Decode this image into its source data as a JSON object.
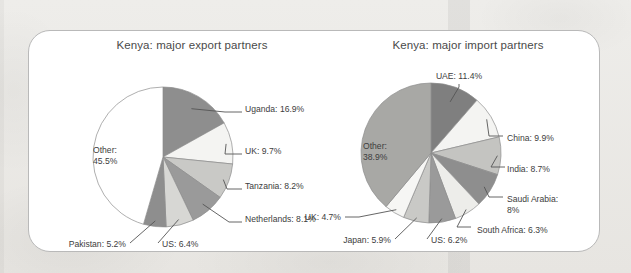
{
  "figure": {
    "background_color": "#ebeae7",
    "card_color": "#ffffff",
    "card_border_color": "#b9b9b9"
  },
  "chart_data": [
    {
      "type": "pie",
      "id": "kenya-major-export-partners",
      "title": "Kenya: major export partners",
      "xlabel": "",
      "ylabel": "",
      "grid": false,
      "legend": "none",
      "label_format": "{name}: {value}%",
      "categories": [
        "Uganda",
        "UK",
        "Tanzania",
        "Netherlands",
        "US",
        "Pakistan",
        "Other"
      ],
      "values": [
        16.9,
        9.7,
        8.2,
        8.1,
        6.4,
        5.2,
        45.5
      ],
      "colors": [
        "#8e8e8e",
        "#f4f4f2",
        "#c9c9c6",
        "#9a9a9a",
        "#d7d7d4",
        "#8e8e8e",
        "#ffffff"
      ],
      "slices": [
        {
          "name": "Uganda",
          "value": 16.9,
          "label": "Uganda: 16.9%",
          "color": "#8e8e8e"
        },
        {
          "name": "UK",
          "value": 9.7,
          "label": "UK: 9.7%",
          "color": "#f4f4f2"
        },
        {
          "name": "Tanzania",
          "value": 8.2,
          "label": "Tanzania: 8.2%",
          "color": "#c9c9c6"
        },
        {
          "name": "Netherlands",
          "value": 8.1,
          "label": "Netherlands: 8.1%",
          "color": "#9a9a9a"
        },
        {
          "name": "US",
          "value": 6.4,
          "label": "US: 6.4%",
          "color": "#d7d7d4"
        },
        {
          "name": "Pakistan",
          "value": 5.2,
          "label": "Pakistan: 5.2%",
          "color": "#8e8e8e"
        },
        {
          "name": "Other",
          "value": 45.5,
          "label": "Other:",
          "label2": "45.5%",
          "color": "#ffffff",
          "inside": true
        }
      ]
    },
    {
      "type": "pie",
      "id": "kenya-major-import-partners",
      "title": "Kenya: major import partners",
      "xlabel": "",
      "ylabel": "",
      "grid": false,
      "legend": "none",
      "label_format": "{name}: {value}%",
      "categories": [
        "UAE",
        "China",
        "India",
        "Saudi Arabia",
        "South Africa",
        "US",
        "Japan",
        "UK",
        "Other"
      ],
      "values": [
        11.4,
        9.9,
        8.7,
        8.0,
        6.3,
        6.2,
        5.9,
        4.7,
        38.9
      ],
      "colors": [
        "#7f7f7f",
        "#f4f4f2",
        "#c4c4c1",
        "#8e8e8e",
        "#ededea",
        "#9a9a9a",
        "#c9c9c6",
        "#f6f6f4",
        "#a8a8a5"
      ],
      "slices": [
        {
          "name": "UAE",
          "value": 11.4,
          "label": "UAE: 11.4%",
          "color": "#7f7f7f"
        },
        {
          "name": "China",
          "value": 9.9,
          "label": "China: 9.9%",
          "color": "#f4f4f2"
        },
        {
          "name": "India",
          "value": 8.7,
          "label": "India: 8.7%",
          "color": "#c4c4c1"
        },
        {
          "name": "Saudi Arabia",
          "value": 8.0,
          "label": "Saudi Arabia:",
          "label2": "8%",
          "color": "#8e8e8e"
        },
        {
          "name": "South Africa",
          "value": 6.3,
          "label": "South Africa: 6.3%",
          "color": "#ededea"
        },
        {
          "name": "US",
          "value": 6.2,
          "label": "US: 6.2%",
          "color": "#9a9a9a"
        },
        {
          "name": "Japan",
          "value": 5.9,
          "label": "Japan: 5.9%",
          "color": "#c9c9c6"
        },
        {
          "name": "UK",
          "value": 4.7,
          "label": "UK: 4.7%",
          "color": "#f6f6f4"
        },
        {
          "name": "Other",
          "value": 38.9,
          "label": "Other:",
          "label2": "38.9%",
          "color": "#a8a8a5",
          "inside": true
        }
      ]
    }
  ]
}
